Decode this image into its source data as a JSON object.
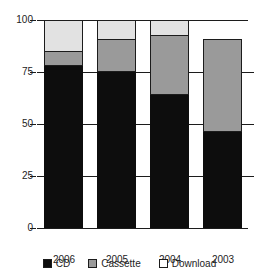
{
  "chart_data": {
    "type": "bar",
    "stacked": true,
    "title": "",
    "subtitle": "",
    "xlabel": "",
    "ylabel": "",
    "categories": [
      "2006",
      "2005",
      "2004",
      "2003"
    ],
    "series": [
      {
        "name": "CD",
        "values": [
          78,
          75,
          64,
          46
        ],
        "color": "#0d0d0d"
      },
      {
        "name": "Cassette",
        "values": [
          7,
          16,
          29,
          45
        ],
        "color": "#9a9a9a"
      },
      {
        "name": "Download",
        "values": [
          15,
          9,
          7,
          0
        ],
        "color": "#e2e2e2"
      }
    ],
    "totals": [
      100,
      100,
      100,
      91
    ],
    "ylim": [
      0,
      100
    ],
    "yticks": [
      0,
      25,
      50,
      75,
      100
    ],
    "ytick_labels": [
      "0",
      "25",
      "50",
      "75",
      "100"
    ],
    "grid": true,
    "legend_position": "bottom",
    "annotations": []
  },
  "axis": {
    "y_ticks": [
      "100",
      "75",
      "50",
      "25",
      "0"
    ]
  },
  "legend": {
    "items": [
      {
        "label": "CD"
      },
      {
        "label": "Cassette"
      },
      {
        "label": "Download"
      }
    ]
  }
}
